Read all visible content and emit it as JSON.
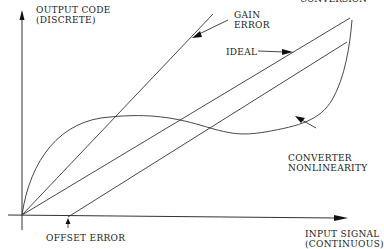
{
  "diagram": {
    "top_cut_text": "CONVERSION",
    "y_axis": {
      "line1": "OUTPUT CODE",
      "line2": "(DISCRETE)"
    },
    "x_axis": {
      "line1": "INPUT SIGNAL",
      "line2": "(CONTINUOUS)"
    },
    "labels": {
      "gain_error": {
        "line1": "GAIN",
        "line2": "ERROR"
      },
      "ideal": "IDEAL",
      "nonlinearity": {
        "line1": "CONVERTER",
        "line2": "NONLINEARITY"
      },
      "offset_error": "OFFSET ERROR"
    },
    "colors": {
      "line": "#333333",
      "text": "#1a1a1a",
      "background": "#ffffff"
    }
  }
}
